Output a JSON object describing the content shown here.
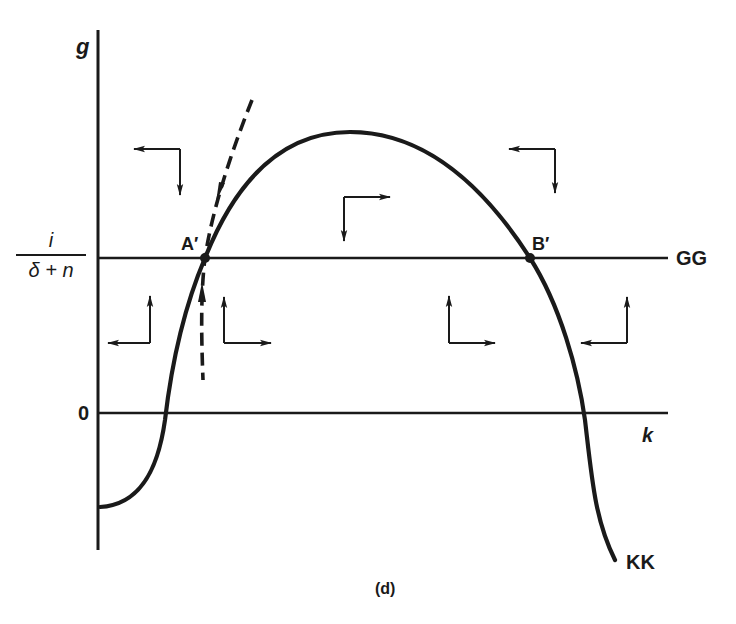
{
  "figure": {
    "panel_label": "(d)",
    "axis_labels": {
      "y": "g",
      "x": "k"
    },
    "y_tick_labels": {
      "zero": "0",
      "fraction": {
        "numerator": "i",
        "denominator": "δ + n"
      }
    },
    "curve_labels": {
      "horizontal_line": "GG",
      "hump_curve": "KK"
    },
    "points": [
      {
        "label": "A′",
        "description": "left intersection of KK and GG (saddle, with dashed stable arm)"
      },
      {
        "label": "B′",
        "description": "right intersection of KK and GG"
      }
    ],
    "colors": {
      "ink": "#1a1a1a",
      "background": "#ffffff"
    },
    "phase_arrows": [
      {
        "region": "upper-left",
        "horizontal": "left",
        "vertical": "down"
      },
      {
        "region": "upper-middle",
        "horizontal": "right",
        "vertical": "down"
      },
      {
        "region": "upper-right",
        "horizontal": "left",
        "vertical": "down"
      },
      {
        "region": "lower-left-outside",
        "horizontal": "left",
        "vertical": "up"
      },
      {
        "region": "lower-left-inside",
        "horizontal": "right",
        "vertical": "up"
      },
      {
        "region": "lower-right-inside",
        "horizontal": "right",
        "vertical": "up"
      },
      {
        "region": "lower-right-outside",
        "horizontal": "left",
        "vertical": "up"
      }
    ]
  }
}
